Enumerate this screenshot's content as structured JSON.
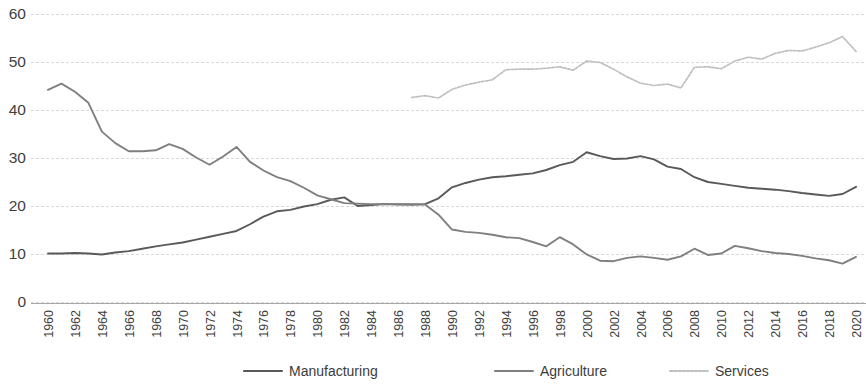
{
  "chart_data": {
    "type": "line",
    "title": "",
    "subtitle": "",
    "xlabel": "",
    "ylabel": "",
    "xlim": [
      1960,
      2020
    ],
    "ylim": [
      0,
      60
    ],
    "grid": true,
    "legend_position": "bottom",
    "y_ticks": [
      0,
      10,
      20,
      30,
      40,
      50,
      60
    ],
    "y_tick_labels": [
      "0",
      "10",
      "20",
      "30",
      "40",
      "50",
      "60"
    ],
    "x_ticks": [
      1960,
      1962,
      1964,
      1966,
      1968,
      1970,
      1972,
      1974,
      1976,
      1978,
      1980,
      1982,
      1984,
      1986,
      1988,
      1990,
      1992,
      1994,
      1996,
      1998,
      2000,
      2002,
      2004,
      2006,
      2008,
      2010,
      2012,
      2014,
      2016,
      2018,
      2020
    ],
    "x_tick_labels": [
      "1960",
      "1962",
      "1964",
      "1966",
      "1968",
      "1970",
      "1972",
      "1974",
      "1976",
      "1978",
      "1980",
      "1982",
      "1984",
      "1986",
      "1988",
      "1990",
      "1992",
      "1994",
      "1996",
      "1998",
      "2000",
      "2002",
      "2004",
      "2006",
      "2008",
      "2010",
      "2012",
      "2014",
      "2016",
      "2018",
      "2020"
    ],
    "series": [
      {
        "name": "Manufacturing",
        "color": "#595959",
        "style": "solid",
        "x": [
          1960,
          1961,
          1962,
          1963,
          1964,
          1965,
          1966,
          1967,
          1968,
          1969,
          1970,
          1971,
          1972,
          1973,
          1974,
          1975,
          1976,
          1977,
          1978,
          1979,
          1980,
          1981,
          1982,
          1983,
          1984,
          1985,
          1986,
          1987,
          1988,
          1989,
          1990,
          1991,
          1992,
          1993,
          1994,
          1995,
          1996,
          1997,
          1998,
          1999,
          2000,
          2001,
          2002,
          2003,
          2004,
          2005,
          2006,
          2007,
          2008,
          2009,
          2010,
          2011,
          2012,
          2013,
          2014,
          2015,
          2016,
          2017,
          2018,
          2019,
          2020
        ],
        "values": [
          10.1,
          10.1,
          10.2,
          10.1,
          9.9,
          10.3,
          10.6,
          11.1,
          11.6,
          12.0,
          12.4,
          13.0,
          13.6,
          14.2,
          14.8,
          16.2,
          17.8,
          18.9,
          19.2,
          19.9,
          20.4,
          21.3,
          21.8,
          20.0,
          20.2,
          20.4,
          20.3,
          20.3,
          20.4,
          21.6,
          23.9,
          24.8,
          25.5,
          26.0,
          26.2,
          26.5,
          26.8,
          27.5,
          28.5,
          29.2,
          31.2,
          30.4,
          29.8,
          29.9,
          30.4,
          29.7,
          28.2,
          27.7,
          26.0,
          25.0,
          24.6,
          24.2,
          23.8,
          23.6,
          23.4,
          23.1,
          22.7,
          22.4,
          22.1,
          22.5,
          24.0
        ]
      },
      {
        "name": "Agriculture",
        "color": "#7f7f7f",
        "style": "solid",
        "x": [
          1960,
          1961,
          1962,
          1963,
          1964,
          1965,
          1966,
          1967,
          1968,
          1969,
          1970,
          1971,
          1972,
          1973,
          1974,
          1975,
          1976,
          1977,
          1978,
          1979,
          1980,
          1981,
          1982,
          1983,
          1984,
          1985,
          1986,
          1987,
          1988,
          1989,
          1990,
          1991,
          1992,
          1993,
          1994,
          1995,
          1996,
          1997,
          1998,
          1999,
          2000,
          2001,
          2002,
          2003,
          2004,
          2005,
          2006,
          2007,
          2008,
          2009,
          2010,
          2011,
          2012,
          2013,
          2014,
          2015,
          2016,
          2017,
          2018,
          2019,
          2020
        ],
        "values": [
          44.2,
          45.5,
          43.8,
          41.5,
          35.5,
          33.1,
          31.4,
          31.4,
          31.6,
          32.9,
          31.9,
          30.1,
          28.6,
          30.3,
          32.3,
          29.2,
          27.4,
          26.0,
          25.2,
          23.8,
          22.2,
          21.4,
          20.6,
          20.5,
          20.4,
          20.4,
          20.4,
          20.3,
          20.3,
          18.2,
          15.1,
          14.6,
          14.4,
          14.0,
          13.5,
          13.3,
          12.5,
          11.6,
          13.5,
          12.0,
          9.9,
          8.6,
          8.5,
          9.2,
          9.5,
          9.2,
          8.8,
          9.5,
          11.1,
          9.8,
          10.1,
          11.7,
          11.2,
          10.6,
          10.2,
          10.0,
          9.6,
          9.1,
          8.7,
          8.0,
          9.4
        ]
      },
      {
        "name": "Services",
        "color": "#bfbfbf",
        "style": "dotted",
        "x": [
          1987,
          1988,
          1989,
          1990,
          1991,
          1992,
          1993,
          1994,
          1995,
          1996,
          1997,
          1998,
          1999,
          2000,
          2001,
          2002,
          2003,
          2004,
          2005,
          2006,
          2007,
          2008,
          2009,
          2010,
          2011,
          2012,
          2013,
          2014,
          2015,
          2016,
          2017,
          2018,
          2019,
          2020
        ],
        "values": [
          42.6,
          43.0,
          42.5,
          44.3,
          45.2,
          45.8,
          46.3,
          48.4,
          48.5,
          48.5,
          48.7,
          49.0,
          48.3,
          50.2,
          49.9,
          48.5,
          46.9,
          45.6,
          45.1,
          45.4,
          44.6,
          48.9,
          49.0,
          48.6,
          50.2,
          51.0,
          50.6,
          51.8,
          52.4,
          52.3,
          53.1,
          54.0,
          55.3,
          52.2
        ]
      }
    ],
    "axis_color": "#808080",
    "grid_color": "#d9d9d9",
    "background": "#ffffff"
  },
  "legend": {
    "items": [
      {
        "label": "Manufacturing",
        "color": "#595959",
        "style": "solid"
      },
      {
        "label": "Agriculture",
        "color": "#7f7f7f",
        "style": "solid"
      },
      {
        "label": "Services",
        "color": "#bfbfbf",
        "style": "dotted"
      }
    ]
  }
}
